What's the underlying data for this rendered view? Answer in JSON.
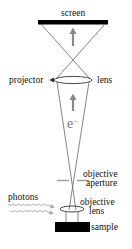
{
  "diagram": {
    "title": "",
    "type": "electron-optics schematic (photoemission electron microscope)",
    "labels": {
      "screen": "screen",
      "projector": "projector",
      "lens": "lens",
      "electron_symbol": "e",
      "electron_charge": "−",
      "objective_aperture_line1": "objective",
      "objective_aperture_line2": "aperture",
      "photons": "photons",
      "objective_lens_line1": "objective",
      "objective_lens_line2": "lens",
      "sample": "sample"
    },
    "colors": {
      "ink": "#111111",
      "gray_arrow": "#888888",
      "ray_lines": "#666666",
      "aperture": "#999999",
      "photon_arrows": "#aaaaaa",
      "block_fill": "#000000"
    },
    "components": [
      {
        "name": "screen",
        "shape": "black bar",
        "position": "top"
      },
      {
        "name": "projector lens",
        "shape": "ellipse"
      },
      {
        "name": "electron beam",
        "shape": "cone with upward arrow"
      },
      {
        "name": "objective aperture",
        "shape": "dashed gray line"
      },
      {
        "name": "objective lens",
        "shape": "small ellipse"
      },
      {
        "name": "photons",
        "shape": "wavy arrows from left"
      },
      {
        "name": "sample",
        "shape": "black block",
        "position": "bottom"
      }
    ]
  }
}
